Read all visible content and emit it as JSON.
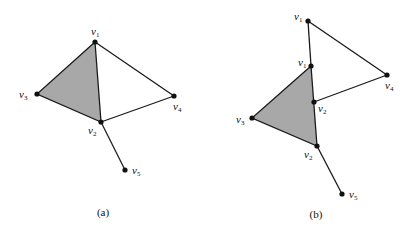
{
  "figures": [
    {
      "id": "a",
      "caption": "(a)",
      "vertices": [
        {
          "name": "v",
          "sub": "1",
          "x": 95,
          "y": 42,
          "lx": 91,
          "ly": 35
        },
        {
          "name": "v",
          "sub": "2",
          "x": 101,
          "y": 122,
          "lx": 88,
          "ly": 134
        },
        {
          "name": "v",
          "sub": "3",
          "x": 37,
          "y": 94,
          "lx": 19,
          "ly": 98
        },
        {
          "name": "v",
          "sub": "4",
          "x": 174,
          "y": 96,
          "lx": 173,
          "ly": 110
        },
        {
          "name": "v",
          "sub": "5",
          "x": 125,
          "y": 170,
          "lx": 132,
          "ly": 174
        }
      ],
      "shaded_face": [
        [
          95,
          42
        ],
        [
          37,
          94
        ],
        [
          101,
          122
        ]
      ],
      "edges": [
        [
          [
            95,
            42
          ],
          [
            174,
            96
          ]
        ],
        [
          [
            174,
            96
          ],
          [
            101,
            122
          ]
        ],
        [
          [
            101,
            122
          ],
          [
            125,
            170
          ]
        ]
      ]
    },
    {
      "id": "b",
      "caption": "(b)",
      "vertices": [
        {
          "name": "v",
          "sub": "1",
          "x": 308,
          "y": 21,
          "lx": 294,
          "ly": 20
        },
        {
          "name": "v",
          "sub": "1",
          "x": 311,
          "y": 66,
          "lx": 298,
          "ly": 66
        },
        {
          "name": "v",
          "sub": "4",
          "x": 387,
          "y": 75,
          "lx": 385,
          "ly": 89
        },
        {
          "name": "v",
          "sub": "2",
          "x": 314,
          "y": 102,
          "lx": 318,
          "ly": 112
        },
        {
          "name": "v",
          "sub": "3",
          "x": 252,
          "y": 118,
          "lx": 236,
          "ly": 123
        },
        {
          "name": "v",
          "sub": "2",
          "x": 317,
          "y": 146,
          "lx": 304,
          "ly": 158
        },
        {
          "name": "v",
          "sub": "5",
          "x": 342,
          "y": 194,
          "lx": 349,
          "ly": 198
        }
      ],
      "shaded_face": [
        [
          311,
          66
        ],
        [
          252,
          118
        ],
        [
          317,
          146
        ]
      ],
      "edges": [
        [
          [
            308,
            21
          ],
          [
            311,
            66
          ]
        ],
        [
          [
            308,
            21
          ],
          [
            387,
            75
          ]
        ],
        [
          [
            387,
            75
          ],
          [
            314,
            102
          ]
        ],
        [
          [
            317,
            146
          ],
          [
            342,
            194
          ]
        ]
      ]
    }
  ],
  "captions": {
    "a": "(a)",
    "b": "(b)"
  }
}
